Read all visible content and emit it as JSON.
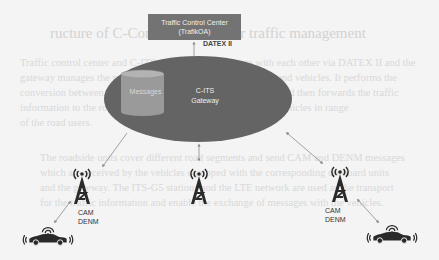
{
  "diagram": {
    "traffic_control_center": {
      "line1": "Traffic Control Center",
      "line2": "(TrafikOA)"
    },
    "link_label": "DATEX II",
    "gateway": {
      "line1": "C-ITS",
      "line2": "Gateway"
    },
    "database_label": "Messages",
    "stations": [
      {
        "id": "left",
        "label_line1": "CAM",
        "label_line2": "DENM"
      },
      {
        "id": "center"
      },
      {
        "id": "right",
        "label_line1": "CAM",
        "label_line2": "DENM"
      }
    ],
    "vehicles": [
      {
        "id": "left-vehicle"
      },
      {
        "id": "right-vehicle"
      }
    ],
    "colors": {
      "box": "#737373",
      "ellipse": "#646464",
      "database": "#9a9a9a",
      "icon": "#2a2a2a",
      "arrow": "#8a8a8a",
      "background": "#f4f4f4"
    }
  },
  "background_bleed": {
    "heading": "ructure of C-Communication for traffic management",
    "lines": [
      "Traffic control center and C-ITS gateway communicate with each other via DATEX II and the",
      "gateway manages the messages received from roadside units and vehicles. It performs the",
      "conversion between DATEX and the CAM/DENM messages and then forwards the traffic",
      "information to the roadside stations which broadcast it to the vehicles in range",
      "of the road users.",
      "The roadside units cover different road segments and send CAM and DENM messages",
      "which are received by the vehicles equipped with the corresponding on-board units",
      "and the gateway. The ITS-G5 stations and the LTE network are used as the transport",
      "for the traffic information and enable the exchange of messages with the vehicles."
    ]
  }
}
